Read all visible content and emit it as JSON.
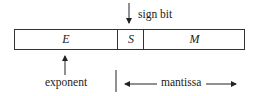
{
  "diagram": {
    "fields": [
      {
        "id": "E",
        "label": "E"
      },
      {
        "id": "S",
        "label": "S"
      },
      {
        "id": "M",
        "label": "M"
      }
    ],
    "annotations": {
      "sign_bit": "sign bit",
      "exponent": "exponent",
      "mantissa": "mantissa"
    },
    "colors": {
      "stroke": "#333333",
      "text": "#1a1a1a",
      "background": "#ffffff"
    }
  }
}
